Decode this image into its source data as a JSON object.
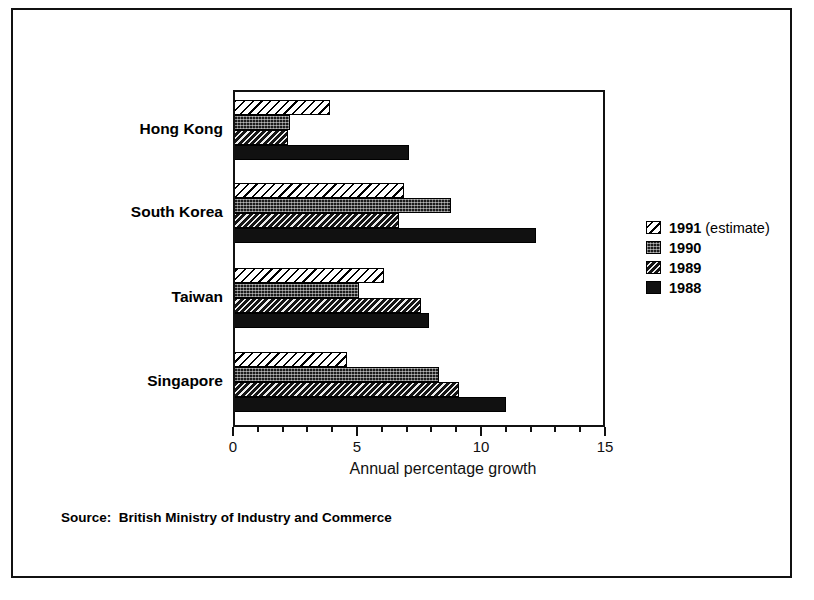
{
  "chart_data": {
    "type": "bar",
    "orientation": "horizontal",
    "title": "",
    "xlabel": "Annual percentage growth",
    "ylabel": "",
    "xlim": [
      0,
      15
    ],
    "xticks": [
      0,
      5,
      10,
      15
    ],
    "xtick_labels": [
      "0",
      "5",
      "10",
      "15"
    ],
    "minor_tick_step": 1,
    "grid": false,
    "categories": [
      "Hong Kong",
      "South Korea",
      "Taiwan",
      "Singapore"
    ],
    "series": [
      {
        "name": "1991 (estimate)",
        "pattern": "light-diagonal-hatch",
        "values": [
          3.9,
          6.9,
          6.1,
          4.6
        ]
      },
      {
        "name": "1990",
        "pattern": "dark-stipple",
        "values": [
          2.3,
          8.8,
          5.1,
          8.3
        ]
      },
      {
        "name": "1989",
        "pattern": "dense-diagonal-hatch",
        "values": [
          2.2,
          6.7,
          7.6,
          9.1
        ]
      },
      {
        "name": "1988",
        "pattern": "solid-black",
        "values": [
          7.1,
          12.2,
          7.9,
          11.0
        ]
      }
    ],
    "legend_position": "right",
    "legend_entries": [
      "1991 (estimate)",
      "1990",
      "1989",
      "1988"
    ],
    "annotations": [
      "Source:  British Ministry of Industry and Commerce"
    ]
  },
  "axis": {
    "title": "Annual percentage growth",
    "ticks": [
      {
        "value": 0,
        "label": "0",
        "major": true
      },
      {
        "value": 1,
        "label": "",
        "major": false
      },
      {
        "value": 2,
        "label": "",
        "major": false
      },
      {
        "value": 3,
        "label": "",
        "major": false
      },
      {
        "value": 4,
        "label": "",
        "major": false
      },
      {
        "value": 5,
        "label": "5",
        "major": true
      },
      {
        "value": 6,
        "label": "",
        "major": false
      },
      {
        "value": 7,
        "label": "",
        "major": false
      },
      {
        "value": 8,
        "label": "",
        "major": false
      },
      {
        "value": 9,
        "label": "",
        "major": false
      },
      {
        "value": 10,
        "label": "10",
        "major": true
      },
      {
        "value": 11,
        "label": "",
        "major": false
      },
      {
        "value": 12,
        "label": "",
        "major": false
      },
      {
        "value": 13,
        "label": "",
        "major": false
      },
      {
        "value": 14,
        "label": "",
        "major": false
      },
      {
        "value": 15,
        "label": "15",
        "major": true
      }
    ]
  },
  "legend": {
    "items": [
      {
        "label_bold": "1991",
        "label_rest": " (estimate)",
        "pattern": "pat-1991"
      },
      {
        "label_bold": "1990",
        "label_rest": "",
        "pattern": "pat-1990"
      },
      {
        "label_bold": "1989",
        "label_rest": "",
        "pattern": "pat-1989"
      },
      {
        "label_bold": "1988",
        "label_rest": "",
        "pattern": "pat-1988"
      }
    ]
  },
  "footer": {
    "source": "Source:  British Ministry of Industry and Commerce"
  },
  "colors": {
    "ink": "#111111",
    "background": "#ffffff"
  }
}
